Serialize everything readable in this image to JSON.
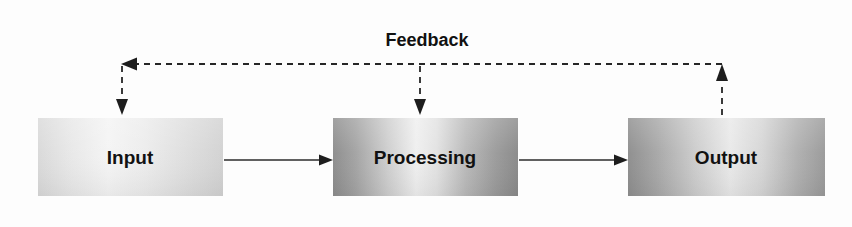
{
  "diagram": {
    "type": "flow-diagram",
    "background_color": "#fdfdfd",
    "nodes": [
      {
        "id": "input",
        "label": "Input",
        "shape": "rectangle",
        "x": 38,
        "y": 118,
        "width": 185,
        "height": 78,
        "fill_light": "#f2f2f2",
        "fill_mid": "#dcdcdc",
        "fill_dark": "#c8c8c8"
      },
      {
        "id": "processing",
        "label": "Processing",
        "shape": "rectangle",
        "x": 333,
        "y": 118,
        "width": 185,
        "height": 78,
        "fill_light": "#f0f0f0",
        "fill_mid": "#b4b4b4",
        "fill_dark": "#8f8f8f"
      },
      {
        "id": "output",
        "label": "Output",
        "shape": "rectangle",
        "x": 628,
        "y": 118,
        "width": 197,
        "height": 78,
        "fill_light": "#ededed",
        "fill_mid": "#b8b8b8",
        "fill_dark": "#909090"
      }
    ],
    "connectors": [
      {
        "id": "input-to-processing",
        "from": "input",
        "to": "processing",
        "style": "solid",
        "label": "",
        "arrowhead": "filled-triangle"
      },
      {
        "id": "processing-to-output",
        "from": "processing",
        "to": "output",
        "style": "solid",
        "label": "",
        "arrowhead": "filled-triangle"
      }
    ],
    "feedback_loop": {
      "label": "Feedback",
      "style": "dashed",
      "line_y": 64,
      "left_x": 122,
      "right_x": 722,
      "branch_x": 420,
      "arrow_targets": [
        "input",
        "processing"
      ],
      "arrow_source": "output",
      "arrowheads": 4
    }
  }
}
